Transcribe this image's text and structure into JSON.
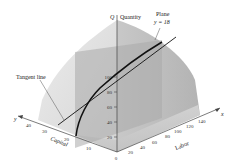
{
  "figure": {
    "z_axis_label": "Q",
    "z_axis_name": "Quantity",
    "plane_label_line1": "Plane",
    "plane_label_line2": "y = 18",
    "tangent_label": "Tangent line",
    "x_axis_letter": "x",
    "y_axis_letter": "y",
    "x_axis_name": "Labor",
    "y_axis_name": "Capital",
    "origin_label": "0",
    "z_ticks": [
      "20",
      "40",
      "60",
      "80",
      "100"
    ],
    "x_ticks": [
      "20",
      "40",
      "60",
      "80",
      "100",
      "120",
      "140"
    ],
    "y_ticks": [
      "10",
      "20",
      "30",
      "40"
    ]
  },
  "colors": {
    "surface_light": "#e6e6e6",
    "surface_mid": "#cfcfcf",
    "surface_dark": "#b8b8b8",
    "plane": "#a9a9a9",
    "curve": "#111111",
    "axis": "#444444"
  }
}
